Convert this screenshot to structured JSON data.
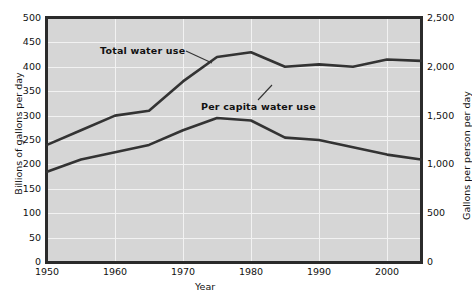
{
  "chart_data": {
    "type": "line",
    "title": "",
    "xlabel": "Year",
    "ylabel": "Billions of gallons per day",
    "y2label": "Gallons per person per day",
    "xlim": [
      1950,
      2005
    ],
    "ylim": [
      0,
      500
    ],
    "y2lim": [
      0,
      2500
    ],
    "grid": true,
    "legend_position": "inline-annotations",
    "xticks": [
      "1950",
      "1960",
      "1970",
      "1980",
      "1990",
      "2000"
    ],
    "xtick_values": [
      1950,
      1960,
      1970,
      1980,
      1990,
      2000
    ],
    "yticks_left": [
      "0",
      "50",
      "100",
      "150",
      "200",
      "250",
      "300",
      "350",
      "400",
      "450",
      "500"
    ],
    "ytick_left_values": [
      0,
      50,
      100,
      150,
      200,
      250,
      300,
      350,
      400,
      450,
      500
    ],
    "yticks_right": [
      "0",
      "500",
      "1,000",
      "1,500",
      "2,000",
      "2,500"
    ],
    "ytick_right_values": [
      0,
      500,
      1000,
      1500,
      2000,
      2500
    ],
    "series": [
      {
        "name": "Total water use",
        "axis": "left",
        "units": "billions of gallons per day",
        "color": "#333333",
        "x": [
          1950,
          1955,
          1960,
          1965,
          1970,
          1975,
          1980,
          1985,
          1990,
          1995,
          2000,
          2005
        ],
        "values": [
          240,
          270,
          300,
          310,
          370,
          420,
          430,
          400,
          405,
          400,
          415,
          412
        ]
      },
      {
        "name": "Per capita water use",
        "axis": "right",
        "units": "gallons per person per day",
        "color": "#333333",
        "x": [
          1950,
          1955,
          1960,
          1965,
          1970,
          1975,
          1980,
          1985,
          1990,
          1995,
          2000,
          2005
        ],
        "values": [
          1850,
          2100,
          2250,
          2400,
          2700,
          2950,
          2900,
          2550,
          2500,
          2350,
          2200,
          2100
        ],
        "values_left_scale": [
          185,
          210,
          225,
          240,
          270,
          295,
          290,
          255,
          250,
          235,
          220,
          210
        ]
      }
    ],
    "annotations": [
      {
        "text": "Total water use",
        "x": 1958,
        "y": 455,
        "points_to": "total-water-use-line"
      },
      {
        "text": "Per capita water use",
        "x": 1972,
        "y": 330,
        "points_to": "per-capita-water-use-line"
      }
    ]
  },
  "colors": {
    "plot_background": "#d6d6d6",
    "gridline": "#f2f2f2",
    "axis": "#2b2b2b",
    "line": "#333333",
    "text": "#111111",
    "page_background": "#ffffff"
  }
}
